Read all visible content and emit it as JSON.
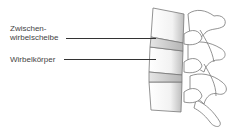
{
  "diagram": {
    "labels": [
      {
        "id": "intervertebral-disc",
        "lines": [
          "Zwischen-",
          "wirbelscheibe"
        ]
      },
      {
        "id": "vertebral-body",
        "text": "Wirbelkörper"
      }
    ]
  }
}
